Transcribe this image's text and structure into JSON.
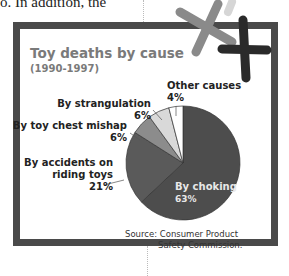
{
  "background_text": "o. In addition, the",
  "chart_data": {
    "type": "pie",
    "title": "Toy deaths by cause",
    "subtitle": "(1990-1997)",
    "slices": [
      {
        "label": "By choking",
        "value": 63,
        "display": "63%",
        "color": "#4d4d4d"
      },
      {
        "label": "By accidents on riding toys",
        "value": 21,
        "display": "21%",
        "color": "#5a5a5a"
      },
      {
        "label": "By toy chest mishap",
        "value": 6,
        "display": "6%",
        "color": "#8c8c8c"
      },
      {
        "label": "By strangulation",
        "value": 6,
        "display": "6%",
        "color": "#d9d9d9"
      },
      {
        "label": "Other causes",
        "value": 4,
        "display": "4%",
        "color": "#ffffff"
      }
    ],
    "source": "Source: Consumer Product Safety Commission."
  },
  "labels": {
    "other_1": "Other causes",
    "other_2": "4%",
    "strang_1": "By strangulation",
    "strang_2": "6%",
    "chest_1": "By toy chest mishap",
    "chest_2": "6%",
    "riding_1": "By accidents on",
    "riding_2": "riding toys",
    "riding_3": "21%",
    "choking_1": "By choking",
    "choking_2": "63%",
    "source_1": "Source: Consumer Product",
    "source_2": "Safety Commission."
  }
}
